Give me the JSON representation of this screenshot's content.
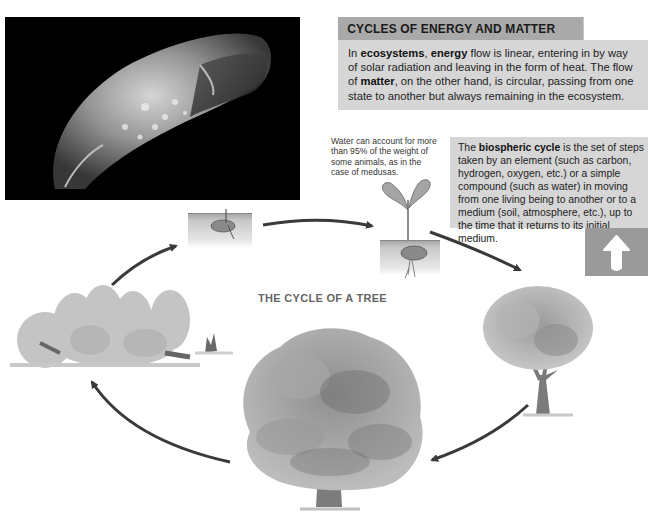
{
  "photo": {
    "subject": "medusa (jellyfish) on black background",
    "icon": "jellyfish-photo"
  },
  "info_panel": {
    "title": "CYCLES OF ENERGY AND MATTER",
    "intro": {
      "t1": "In ",
      "b1": "ecosystems",
      "t2": ", ",
      "b2": "energy",
      "t3": " flow is linear, entering in by way of solar radiation and leaving in the form of heat. The flow of ",
      "b3": "matter",
      "t4": ", on the other hand, is circular, passing from one state to another but always remaining in the ecosystem."
    }
  },
  "note": {
    "text": "Water can account for more than 95% of the weight of some animals, as in the case of medusas."
  },
  "biospheric": {
    "t1": "The ",
    "b1": "biospheric cycle",
    "t2": " is the set of steps taken by an element (such as carbon, hydrogen, oxygen, etc.) or a simple compound (such as water) in moving from one living being to another or to a medium (soil, atmosphere, etc.), up to the time that it returns to its initial medium."
  },
  "up_arrow": {
    "icon": "up-arrow-icon"
  },
  "diagram": {
    "title": "THE CYCLE OF A TREE",
    "stages": [
      {
        "name": "seed",
        "label": "seed in soil"
      },
      {
        "name": "seedling",
        "label": "sprouting seedling"
      },
      {
        "name": "young-tree",
        "label": "young tree"
      },
      {
        "name": "mature-tree",
        "label": "mature tree"
      },
      {
        "name": "decaying-forest",
        "label": "fallen trees and decomposition"
      }
    ]
  },
  "colors": {
    "header_bg": "#a9a9a9",
    "box_bg": "#d6d6d6",
    "arrow_box_bg": "#9a9a9a",
    "arrow": "#3a3a3a",
    "title_gray": "#666666"
  }
}
